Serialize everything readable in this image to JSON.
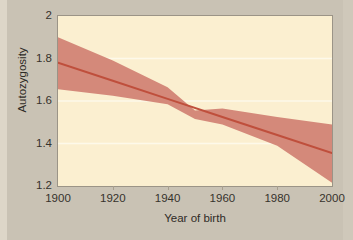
{
  "figure": {
    "background_color": "#c9c2b4",
    "plot_background_color": "#fbefd0",
    "frame_color": "#9b9487",
    "gridline_color": "#fdf9ea"
  },
  "chart_data": {
    "type": "line",
    "title": "",
    "subtitle": "",
    "xlabel": "Year of birth",
    "ylabel": "Autozygosity",
    "xlim": [
      1900,
      2000
    ],
    "ylim": [
      1.2,
      2.0
    ],
    "xticks": [
      1900,
      1920,
      1940,
      1960,
      1980,
      2000
    ],
    "xtick_labels": [
      "1900",
      "1920",
      "1940",
      "1960",
      "1980",
      "2000"
    ],
    "yticks": [
      1.2,
      1.4,
      1.6,
      1.8,
      2.0
    ],
    "ytick_labels": [
      "1.2",
      "1.4",
      "1.6",
      "1.8",
      "2"
    ],
    "grid": "horizontal",
    "legend": "none",
    "annotations": [],
    "series": [
      {
        "name": "Autozygosity trend",
        "kind": "line",
        "color": "#bf4f3c",
        "line_width": 2,
        "x": [
          1900,
          1920,
          1940,
          1960,
          1980,
          2000
        ],
        "values": [
          1.78,
          1.695,
          1.61,
          1.525,
          1.44,
          1.355
        ]
      },
      {
        "name": "95% confidence interval",
        "kind": "band",
        "color": "#d4897a",
        "opacity": 1,
        "x": [
          1900,
          1920,
          1940,
          1950,
          1960,
          1980,
          2000
        ],
        "lower": [
          1.655,
          1.625,
          1.585,
          1.515,
          1.49,
          1.39,
          1.215
        ],
        "upper": [
          1.9,
          1.79,
          1.665,
          1.555,
          1.565,
          1.525,
          1.49
        ]
      }
    ]
  }
}
